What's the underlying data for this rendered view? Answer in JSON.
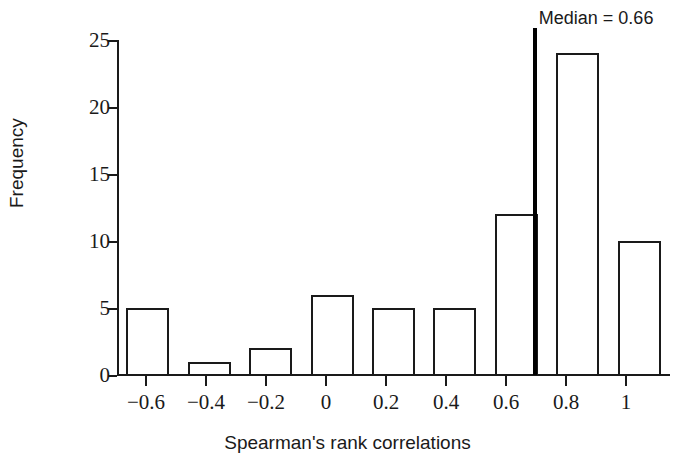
{
  "chart_data": {
    "type": "bar",
    "title": "",
    "xlabel": "Spearman's rank correlations",
    "ylabel": "Frequency",
    "categories": [
      "-0.6",
      "-0.4",
      "-0.2",
      "0",
      "0.2",
      "0.4",
      "0.6",
      "0.8",
      "1"
    ],
    "values": [
      5,
      1,
      2,
      6,
      5,
      5,
      12,
      24,
      10
    ],
    "bin_centers": [
      -0.6,
      -0.4,
      -0.2,
      0,
      0.2,
      0.4,
      0.6,
      0.8,
      1
    ],
    "xlim": [
      -0.7,
      1.1
    ],
    "ylim": [
      0,
      25
    ],
    "x_ticks": [
      "−0.6",
      "−0.4",
      "−0.2",
      "0",
      "0.2",
      "0.4",
      "0.6",
      "0.8",
      "1"
    ],
    "y_ticks": [
      "0",
      "5",
      "10",
      "15",
      "20",
      "25"
    ],
    "y_tick_values": [
      0,
      5,
      10,
      15,
      20,
      25
    ],
    "grid": false,
    "legend": false,
    "annotations": [
      {
        "name": "median",
        "label": "Median = 0.66",
        "value": 0.66,
        "color": "#000000"
      }
    ],
    "bar_style": {
      "fill": "#ffffff",
      "edge": "#1a1a1a"
    }
  }
}
